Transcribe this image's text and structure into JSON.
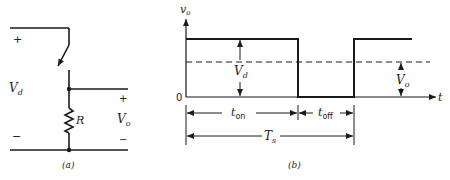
{
  "circuit": {
    "caption": "(a)",
    "source_label": "V",
    "source_sub": "d",
    "plus": "+",
    "minus": "−",
    "resistor_label": "R",
    "output_label": "V",
    "output_sub": "o",
    "output_plus": "+",
    "output_minus": "−"
  },
  "waveform": {
    "caption": "(b)",
    "y_axis_label": "v",
    "y_axis_sub": "o",
    "x_axis_label": "t",
    "zero_label": "0",
    "amplitude_label": "V",
    "amplitude_sub": "d",
    "average_label": "V",
    "average_sub": "o",
    "t_on_label": "t",
    "t_on_sub": "on",
    "t_off_label": "t",
    "t_off_sub": "off",
    "period_label": "T",
    "period_sub": "s"
  },
  "colors": {
    "stroke": "#1a1a1a",
    "text": "#222222"
  }
}
